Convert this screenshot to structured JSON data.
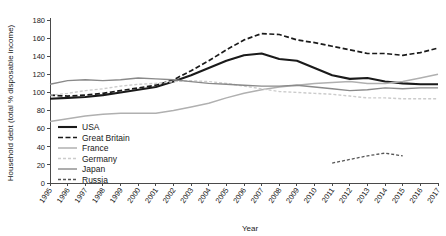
{
  "chart_data": {
    "type": "line",
    "title": "",
    "xlabel": "Year",
    "ylabel": "Household debt (total % disposable income)",
    "ylim": [
      0,
      180
    ],
    "yticks": [
      0,
      20,
      40,
      60,
      80,
      100,
      120,
      140,
      160,
      180
    ],
    "grid": false,
    "legend_position": "inside-lower-left",
    "categories": [
      "1995",
      "1996",
      "1997",
      "1998",
      "1999",
      "2000",
      "2001",
      "2002",
      "2003",
      "2004",
      "2005",
      "2006",
      "2007",
      "2008",
      "2009",
      "2010",
      "2011",
      "2012",
      "2013",
      "2014",
      "2015",
      "2016",
      "2017"
    ],
    "x": [
      1995,
      1996,
      1997,
      1998,
      1999,
      2000,
      2001,
      2002,
      2003,
      2004,
      2005,
      2006,
      2007,
      2008,
      2009,
      2010,
      2011,
      2012,
      2013,
      2014,
      2015,
      2016,
      2017
    ],
    "series": [
      {
        "name": "USA",
        "color": "#1a1a1a",
        "width": 2.1,
        "dash": "none",
        "values": [
          93,
          94,
          95,
          97,
          100,
          103,
          106,
          112,
          119,
          127,
          135,
          141,
          143,
          137,
          135,
          127,
          119,
          115,
          116,
          112,
          110,
          109,
          109
        ]
      },
      {
        "name": "Great Britain",
        "color": "#1a1a1a",
        "width": 1.7,
        "dash": "5,2.5",
        "values": [
          97,
          96,
          97,
          99,
          102,
          105,
          108,
          114,
          124,
          135,
          147,
          158,
          165,
          164,
          158,
          155,
          151,
          147,
          143,
          143,
          141,
          144,
          149
        ]
      },
      {
        "name": "France",
        "color": "#b0b0b0",
        "width": 1.5,
        "dash": "none",
        "values": [
          68,
          71,
          74,
          76,
          77,
          77,
          77,
          80,
          84,
          88,
          94,
          99,
          103,
          106,
          108,
          110,
          111,
          112,
          110,
          110,
          112,
          116,
          120
        ]
      },
      {
        "name": "Germany",
        "color": "#cccccc",
        "width": 1.4,
        "dash": "3,2"
      },
      {
        "name": "Japan",
        "color": "#8a8a8a",
        "width": 1.4,
        "dash": "none",
        "values": [
          109,
          113,
          114,
          113,
          114,
          116,
          115,
          114,
          112,
          110,
          109,
          108,
          107,
          107,
          108,
          106,
          104,
          102,
          103,
          105,
          104,
          105,
          105
        ]
      },
      {
        "name": "Russia",
        "color": "#555555",
        "width": 1.3,
        "dash": "3,2"
      }
    ],
    "germany_values": [
      97,
      99,
      102,
      104,
      107,
      109,
      110,
      112,
      113,
      112,
      110,
      107,
      104,
      101,
      100,
      99,
      98,
      96,
      94,
      94,
      93,
      93,
      93
    ],
    "russia_x": [
      2011,
      2012,
      2013,
      2014,
      2015
    ],
    "russia_values": [
      22,
      26,
      30,
      33,
      30
    ],
    "annotations": []
  },
  "legend": {
    "items": [
      {
        "label": "USA"
      },
      {
        "label": "Great Britain"
      },
      {
        "label": "France"
      },
      {
        "label": "Germany"
      },
      {
        "label": "Japan"
      },
      {
        "label": "Russia"
      }
    ]
  },
  "axes": {
    "ylabel": "Household debt (total % disposable income)",
    "xlabel": "Year"
  }
}
